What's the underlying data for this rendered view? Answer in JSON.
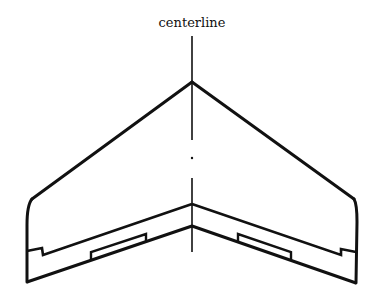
{
  "diagram": {
    "labels": {
      "centerline": "centerline"
    },
    "colors": {
      "stroke": "#111111",
      "background": "#ffffff"
    },
    "parts": [
      "centerline",
      "leading-edge-left",
      "leading-edge-right",
      "wingtip-left",
      "wingtip-right",
      "trailing-edge",
      "elevon-hinge-line",
      "elevon-tab-left",
      "elevon-tab-right"
    ]
  }
}
